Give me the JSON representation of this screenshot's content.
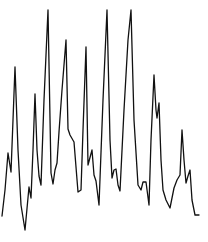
{
  "chart_data": {
    "type": "line",
    "title": "",
    "xlabel": "",
    "ylabel": "",
    "grid": false,
    "legend": null,
    "axes_visible": false,
    "line_color": "#111111",
    "background": "#ffffff",
    "xlim": [
      0,
      208
    ],
    "ylim_pixels": [
      0,
      242
    ],
    "series": [
      {
        "name": "signal",
        "points": [
          [
            2,
            216
          ],
          [
            5,
            190
          ],
          [
            8,
            153
          ],
          [
            11,
            172
          ],
          [
            13,
            120
          ],
          [
            15,
            67
          ],
          [
            18,
            150
          ],
          [
            21,
            205
          ],
          [
            25,
            230
          ],
          [
            29,
            187
          ],
          [
            31,
            198
          ],
          [
            33,
            150
          ],
          [
            35,
            94
          ],
          [
            37,
            150
          ],
          [
            39,
            176
          ],
          [
            41,
            185
          ],
          [
            44,
            100
          ],
          [
            48,
            10
          ],
          [
            51,
            173
          ],
          [
            53,
            184
          ],
          [
            55,
            170
          ],
          [
            57,
            163
          ],
          [
            59,
            132
          ],
          [
            62,
            90
          ],
          [
            66,
            40
          ],
          [
            68,
            129
          ],
          [
            70,
            135
          ],
          [
            74,
            142
          ],
          [
            78,
            192
          ],
          [
            81,
            190
          ],
          [
            83,
            130
          ],
          [
            86,
            47
          ],
          [
            88,
            165
          ],
          [
            92,
            150
          ],
          [
            94,
            175
          ],
          [
            96,
            181
          ],
          [
            99,
            205
          ],
          [
            103,
            100
          ],
          [
            107,
            10
          ],
          [
            110,
            140
          ],
          [
            112,
            178
          ],
          [
            114,
            170
          ],
          [
            116,
            169
          ],
          [
            118,
            185
          ],
          [
            120,
            191
          ],
          [
            124,
            110
          ],
          [
            128,
            40
          ],
          [
            131,
            10
          ],
          [
            134,
            120
          ],
          [
            138,
            185
          ],
          [
            141,
            190
          ],
          [
            143,
            182
          ],
          [
            146,
            182
          ],
          [
            149,
            205
          ],
          [
            151,
            140
          ],
          [
            154,
            75
          ],
          [
            156,
            110
          ],
          [
            157,
            118
          ],
          [
            159,
            103
          ],
          [
            161,
            160
          ],
          [
            163,
            190
          ],
          [
            166,
            200
          ],
          [
            170,
            208
          ],
          [
            172,
            198
          ],
          [
            174,
            188
          ],
          [
            177,
            180
          ],
          [
            180,
            175
          ],
          [
            182,
            130
          ],
          [
            184,
            160
          ],
          [
            186,
            183
          ],
          [
            188,
            176
          ],
          [
            190,
            170
          ],
          [
            192,
            200
          ],
          [
            195,
            215
          ],
          [
            199,
            215
          ]
        ]
      }
    ]
  }
}
